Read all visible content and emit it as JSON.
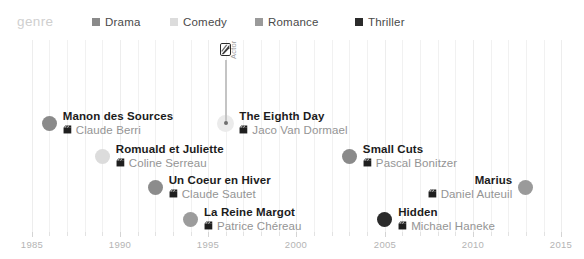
{
  "legend": {
    "title": "genre",
    "items": [
      {
        "label": "Drama",
        "color": "#8a8a8a",
        "swatch_icon": "square-swatch"
      },
      {
        "label": "Comedy",
        "color": "#dcdcdc",
        "swatch_icon": "square-swatch"
      },
      {
        "label": "Romance",
        "color": "#9a9a9a",
        "swatch_icon": "square-swatch"
      },
      {
        "label": "Thriller",
        "color": "#2b2b2b",
        "swatch_icon": "square-swatch"
      }
    ]
  },
  "axis": {
    "label_years": [
      "1985",
      "1990",
      "1995",
      "2000",
      "2005",
      "2010",
      "2015"
    ],
    "min_year": 1984,
    "max_year": 2015.5,
    "all_tick_years": [
      1985,
      1986,
      1987,
      1988,
      1989,
      1990,
      1991,
      1992,
      1993,
      1994,
      1995,
      1996,
      1997,
      1998,
      1999,
      2000,
      2001,
      2002,
      2003,
      2004,
      2005,
      2006,
      2007,
      2008,
      2009,
      2010,
      2011,
      2012,
      2013,
      2014,
      2015
    ]
  },
  "chart_data": {
    "type": "scatter",
    "title": "genre",
    "xlabel": "",
    "ylabel": "",
    "xlim": [
      1984,
      2015.5
    ],
    "grid": true,
    "legend_position": "top",
    "series": [
      {
        "name": "Drama",
        "color": "#8a8a8a"
      },
      {
        "name": "Comedy",
        "color": "#dcdcdc"
      },
      {
        "name": "Romance",
        "color": "#9a9a9a"
      },
      {
        "name": "Thriller",
        "color": "#2b2b2b"
      }
    ],
    "points": [
      {
        "title": "Manon des Sources",
        "director": "Claude Berri",
        "year": 1986,
        "genre": "Drama",
        "color": "#8a8a8a",
        "row": 0,
        "align": "left",
        "director_icon": "film-clapper-icon"
      },
      {
        "title": "The Eighth Day",
        "director": "Jaco Van Dormael",
        "year": 1996,
        "genre": "Comedy",
        "color": "#dcdcdc",
        "row": 0,
        "align": "left",
        "director_icon": "film-clapper-icon"
      },
      {
        "title": "Romuald et Juliette",
        "director": "Coline Serreau",
        "year": 1989,
        "genre": "Comedy",
        "color": "#dcdcdc",
        "row": 1,
        "align": "left",
        "director_icon": "film-clapper-icon"
      },
      {
        "title": "Small Cuts",
        "director": "Pascal Bonitzer",
        "year": 2003,
        "genre": "Drama",
        "color": "#8a8a8a",
        "row": 1,
        "align": "left",
        "director_icon": "film-clapper-icon"
      },
      {
        "title": "Un Coeur en Hiver",
        "director": "Claude Sautet",
        "year": 1992,
        "genre": "Romance",
        "color": "#8c8c8c",
        "row": 2,
        "align": "left",
        "director_icon": "film-clapper-icon"
      },
      {
        "title": "Marius",
        "director": "Daniel Auteuil",
        "year": 2013,
        "genre": "Drama",
        "color": "#9a9a9a",
        "row": 2,
        "align": "right",
        "director_icon": "film-clapper-icon"
      },
      {
        "title": "La Reine Margot",
        "director": "Patrice Chéreau",
        "year": 1994,
        "genre": "Drama",
        "color": "#9c9c9c",
        "row": 3,
        "align": "left",
        "director_icon": "film-clapper-icon"
      },
      {
        "title": "Hidden",
        "director": "Michael Haneke",
        "year": 2005,
        "genre": "Thriller",
        "color": "#2b2b2b",
        "row": 3,
        "align": "left",
        "director_icon": "film-clapper-icon"
      }
    ],
    "annotation": {
      "label": "Actor",
      "attached_to": "The Eighth Day",
      "year": 1996,
      "icon": "actor-portrait-icon"
    }
  }
}
